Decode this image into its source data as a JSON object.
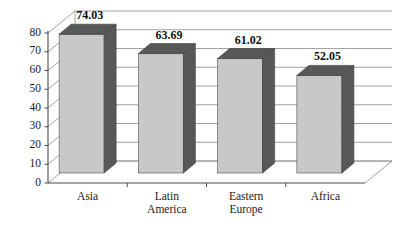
{
  "chart_data": {
    "type": "bar",
    "title": "",
    "subtitle": "",
    "xlabel": "",
    "ylabel": "",
    "categories": [
      "Asia",
      "Latin America",
      "Eastern Europe",
      "Africa"
    ],
    "category_lines": [
      [
        "Asia"
      ],
      [
        "Latin",
        "America"
      ],
      [
        "Eastern",
        "Europe"
      ],
      [
        "Africa"
      ]
    ],
    "values": [
      74.03,
      63.69,
      61.02,
      52.05
    ],
    "value_labels": [
      "74.03",
      "63.69",
      "61.02",
      "52.05"
    ],
    "ylim": [
      0,
      80
    ],
    "ytick_step": 10,
    "ytick_labels": [
      "0",
      "10",
      "20",
      "30",
      "40",
      "50",
      "60",
      "70",
      "80"
    ],
    "ytick_values": [
      0,
      10,
      20,
      30,
      40,
      50,
      60,
      70,
      80
    ],
    "grid": true,
    "grid_orientation": "horizontal",
    "legend": false,
    "legend_position": "none",
    "style": "3d-column",
    "series": [
      {
        "name": "",
        "values": [
          74.03,
          63.69,
          61.02,
          52.05
        ]
      }
    ]
  },
  "colors": {
    "bar_front": "#c8c8c8",
    "bar_side": "#585858",
    "bar_top": "#585858",
    "gridline": "#8a8a8a",
    "axis": "#4a4a4a",
    "background": "#ffffff",
    "text": "#1a1a1a"
  }
}
